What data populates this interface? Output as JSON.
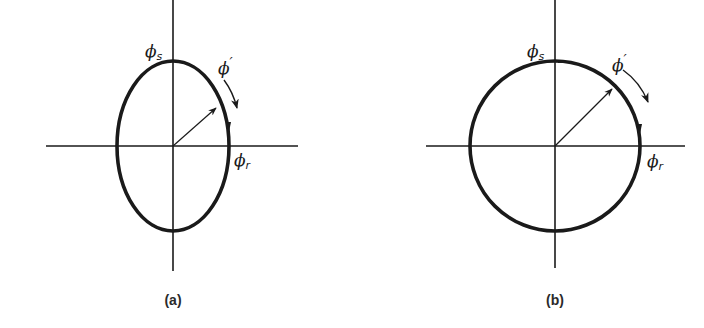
{
  "figure": {
    "colors": {
      "ink": "#1a1a1a",
      "background": "#ffffff"
    },
    "panels": [
      {
        "id": "a",
        "caption": "(a)",
        "shape": "ellipse",
        "center": [
          173,
          146
        ],
        "rx": 56,
        "ry": 85,
        "labels": {
          "top": {
            "symbol": "ϕ",
            "subscript": "s"
          },
          "right": {
            "symbol": "ϕ",
            "subscript": "r"
          },
          "rotating": {
            "symbol": "ϕ",
            "prime": "′"
          }
        }
      },
      {
        "id": "b",
        "caption": "(b)",
        "shape": "circle",
        "center": [
          555,
          146
        ],
        "r": 85,
        "labels": {
          "top": {
            "symbol": "ϕ",
            "subscript": "s"
          },
          "right": {
            "symbol": "ϕ",
            "subscript": "r"
          },
          "rotating": {
            "symbol": "ϕ",
            "prime": "′"
          }
        }
      }
    ]
  }
}
